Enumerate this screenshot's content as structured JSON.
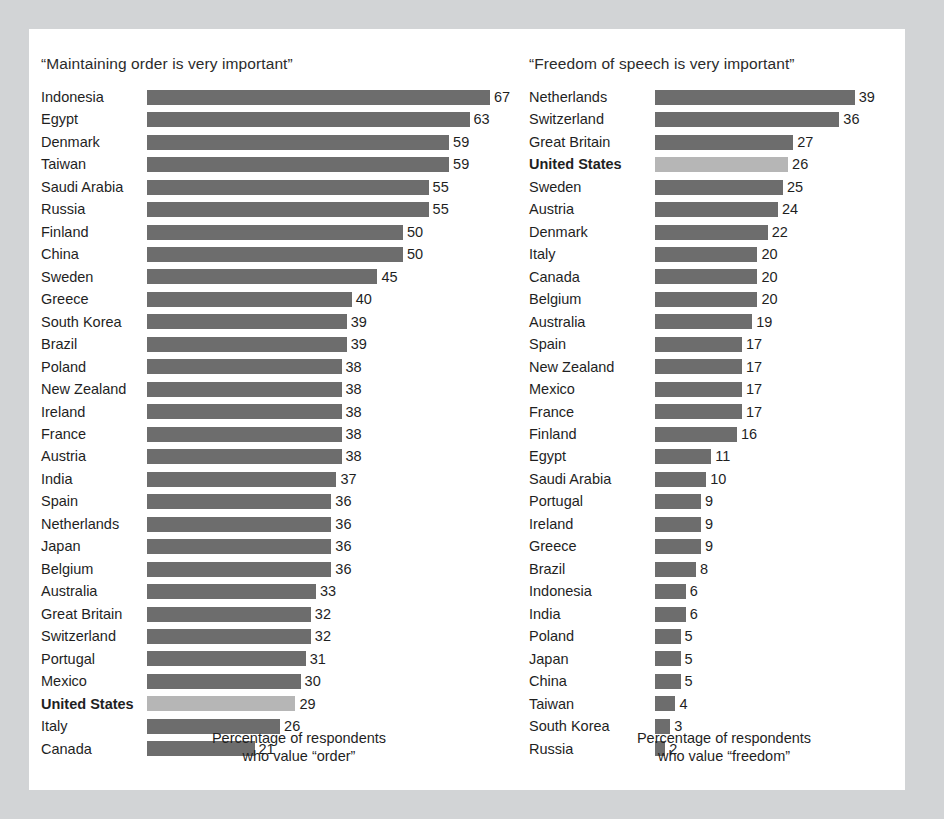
{
  "theme": {
    "page_background": "#d2d4d6",
    "panel_background": "#ffffff",
    "bar_color": "#6d6d6d",
    "highlight_bar_color": "#b6b6b6",
    "text_color": "#1f1f1f"
  },
  "chart_data": [
    {
      "type": "bar",
      "orientation": "horizontal",
      "title": "“Maintaining order is very important”",
      "xlabel": "Percentage of respondents who value “order”",
      "caption_line1": "Percentage of respondents",
      "caption_line2": "who value “order”",
      "ylabel": "",
      "xlim": [
        0,
        67
      ],
      "grid": false,
      "legend": "none",
      "highlight": "United States",
      "categories": [
        "Indonesia",
        "Egypt",
        "Denmark",
        "Taiwan",
        "Saudi Arabia",
        "Russia",
        "Finland",
        "China",
        "Sweden",
        "Greece",
        "South Korea",
        "Brazil",
        "Poland",
        "New Zealand",
        "Ireland",
        "France",
        "Austria",
        "India",
        "Spain",
        "Netherlands",
        "Japan",
        "Belgium",
        "Australia",
        "Great Britain",
        "Switzerland",
        "Portugal",
        "Mexico",
        "United States",
        "Italy",
        "Canada"
      ],
      "values": [
        67,
        63,
        59,
        59,
        55,
        55,
        50,
        50,
        45,
        40,
        39,
        39,
        38,
        38,
        38,
        38,
        38,
        37,
        36,
        36,
        36,
        36,
        33,
        32,
        32,
        31,
        30,
        29,
        26,
        21
      ]
    },
    {
      "type": "bar",
      "orientation": "horizontal",
      "title": "“Freedom of speech is very important”",
      "xlabel": "Percentage of respondents who value “freedom”",
      "caption_line1": "Percentage of respondents",
      "caption_line2": "who value “freedom”",
      "ylabel": "",
      "xlim": [
        0,
        39
      ],
      "grid": false,
      "legend": "none",
      "highlight": "United States",
      "categories": [
        "Netherlands",
        "Switzerland",
        "Great Britain",
        "United States",
        "Sweden",
        "Austria",
        "Denmark",
        "Italy",
        "Canada",
        "Belgium",
        "Australia",
        "Spain",
        "New Zealand",
        "Mexico",
        "France",
        "Finland",
        "Egypt",
        "Saudi Arabia",
        "Portugal",
        "Ireland",
        "Greece",
        "Brazil",
        "Indonesia",
        "India",
        "Poland",
        "Japan",
        "China",
        "Taiwan",
        "South Korea",
        "Russia"
      ],
      "values": [
        39,
        36,
        27,
        26,
        25,
        24,
        22,
        20,
        20,
        20,
        19,
        17,
        17,
        17,
        17,
        16,
        11,
        10,
        9,
        9,
        9,
        8,
        6,
        6,
        5,
        5,
        5,
        4,
        3,
        2
      ]
    }
  ]
}
